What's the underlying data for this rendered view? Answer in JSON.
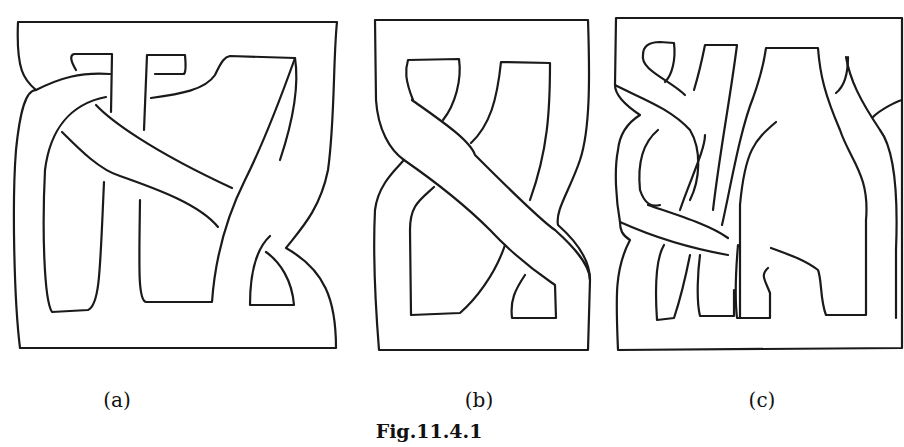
{
  "figure": {
    "panels": [
      {
        "id": "a",
        "label": "(a)",
        "description": "knotted band diagram with three strands"
      },
      {
        "id": "b",
        "label": "(b)",
        "description": "twisted band diagram forming figure-eight shape"
      },
      {
        "id": "c",
        "label": "(c)",
        "description": "braided band diagram with multiple strands"
      }
    ],
    "caption": "Fig.11.4.1"
  },
  "colors": {
    "stroke": "#1a1a1a",
    "background": "#ffffff"
  }
}
